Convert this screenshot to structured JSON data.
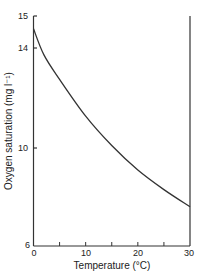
{
  "chart_data": {
    "type": "line",
    "title": "",
    "xlabel": "Temperature (°C)",
    "ylabel": "Oxygen saturation (mg l⁻¹)",
    "xlim": [
      0,
      30
    ],
    "ylim": [
      6,
      15
    ],
    "x_ticks": [
      0,
      5,
      10,
      15,
      20,
      25,
      30
    ],
    "x_tick_labels": [
      "0",
      "10",
      "20",
      "30"
    ],
    "y_tick_labels": [
      "6",
      "10",
      "14",
      "15"
    ],
    "grid": false,
    "legend": null,
    "series": [
      {
        "name": "Oxygen saturation",
        "x": [
          0,
          2,
          5,
          10,
          15,
          20,
          25,
          30
        ],
        "values": [
          14.6,
          13.8,
          12.8,
          11.3,
          10.1,
          9.1,
          8.3,
          7.6
        ]
      }
    ]
  }
}
